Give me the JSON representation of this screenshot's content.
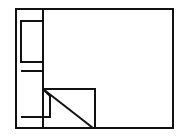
{
  "canvas": {
    "width": 183,
    "height": 139,
    "background": "#ffffff"
  },
  "style": {
    "stroke": "#111111",
    "stroke_width": 2
  },
  "shapes": {
    "outer_frame": {
      "x": 16,
      "y": 9,
      "w": 157,
      "h": 119
    },
    "divider": {
      "x1": 43,
      "y1": 9,
      "x2": 43,
      "y2": 89
    },
    "upper_block": {
      "x": 21,
      "y": 21,
      "w": 22,
      "h": 41
    },
    "lower_block_points": "21,71 43,71 43,89 50,96 50,117 21,117",
    "flap_rect": {
      "x": 43,
      "y": 89,
      "w": 52,
      "h": 39
    },
    "flap_diagonal": {
      "x1": 43,
      "y1": 89,
      "x2": 93,
      "y2": 128
    }
  }
}
